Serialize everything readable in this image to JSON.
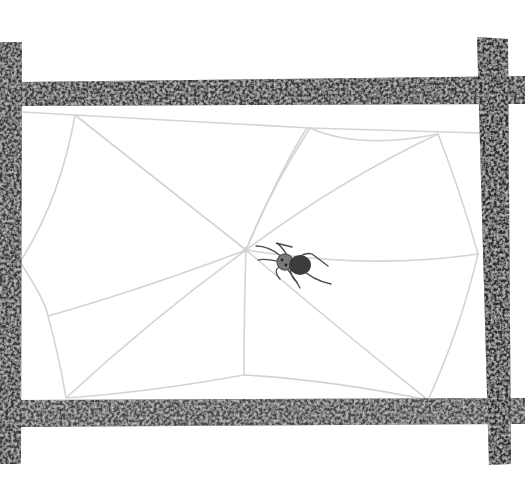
{
  "scene": {
    "title": "Spider on a web within a wooden frame",
    "colors": {
      "background": "#ffffff",
      "frame_dark": "#2a2a2a",
      "frame_mid": "#5a5a5a",
      "frame_light": "#9a9a9a",
      "web_thread": "#d4d4d4",
      "spider_body": "#3c3c3c",
      "spider_head": "#7a7a7a"
    },
    "frame": {
      "bars": [
        "top",
        "bottom",
        "left",
        "right"
      ],
      "texture": "speckled"
    },
    "web": {
      "radial_threads": 8,
      "style": "irregular polygon"
    },
    "spider": {
      "legs": 8,
      "position": "right of web hub"
    }
  }
}
